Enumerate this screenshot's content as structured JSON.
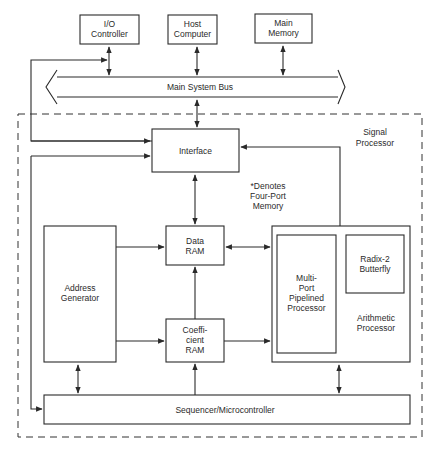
{
  "diagram": {
    "external": {
      "io_controller": [
        "I/O",
        "Controller"
      ],
      "host_computer": [
        "Host",
        "Computer"
      ],
      "main_memory": [
        "Main",
        "Memory"
      ]
    },
    "bus": {
      "label": "Main System Bus"
    },
    "signal_processor": {
      "label": [
        "Signal",
        "Processor"
      ],
      "note": [
        "*Denotes",
        "Four-Port",
        "Memory"
      ],
      "interface": "Interface",
      "address_generator": [
        "Address",
        "Generator"
      ],
      "data_ram": [
        "Data",
        "RAM"
      ],
      "coefficient_ram": [
        "Coeffi-",
        "cient",
        "RAM"
      ],
      "arithmetic_processor": {
        "label": [
          "Arithmetic",
          "Processor"
        ],
        "multiport": [
          "Multi-",
          "Port",
          "Pipelined",
          "Processor"
        ],
        "radix2": [
          "Radix-2",
          "Butterfly"
        ]
      },
      "sequencer": "Sequencer/Microcontroller"
    }
  }
}
